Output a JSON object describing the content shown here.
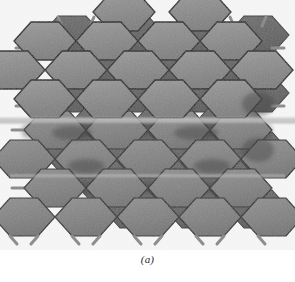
{
  "figure": {
    "caption": "(a)",
    "background_color": "#ffffff",
    "palette": {
      "face_light": "#9a9a9a",
      "face_mid": "#8a8a8a",
      "face_dark": "#6f6f6f",
      "face_darker": "#5d5d5d",
      "face_highlight": "#b4b4b4",
      "edge": "#1c1c1c",
      "bond_stub": "#8e8e8e",
      "bond_stub_edge": "#6a6a6a",
      "shadow": "#4a4a4a"
    },
    "geometry": {
      "hex_width": 62,
      "hex_height": 38,
      "hex_flat_top_width": 28,
      "row_pitch": 29,
      "col_pitch": 62,
      "rows": 7,
      "cols": 5,
      "stub_length": 9,
      "stub_thickness": 3
    },
    "layers": [
      {
        "name": "upper-sheet",
        "rows": 4,
        "x_offset": 0,
        "y_offset": 0,
        "shade": "#8a8a8a"
      },
      {
        "name": "lower-sheet",
        "rows": 3,
        "x_offset": -10,
        "y_offset": 6,
        "shade": "#7d7d7d"
      },
      {
        "name": "back-sheet",
        "rows": 7,
        "x_offset": 16,
        "y_offset": 10,
        "shade": "#5d5d5d"
      }
    ],
    "annotations": {
      "glide_band_y": 120,
      "glide_band_height": 7,
      "glide_band_color": "#b9b9b9"
    }
  }
}
